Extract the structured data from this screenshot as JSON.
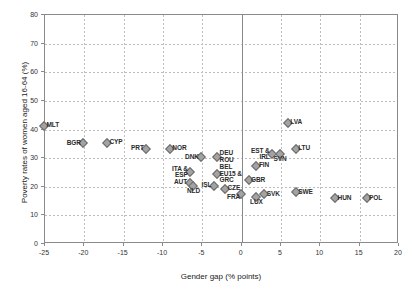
{
  "chart_data": {
    "type": "scatter",
    "title": "",
    "xlabel": "Gender gap (% points)",
    "ylabel": "Poverty rates of women aged 16-64 (%)",
    "xlim": [
      -25,
      20
    ],
    "ylim": [
      0,
      80
    ],
    "xticks": [
      "-25",
      "-20",
      "-15",
      "-10",
      "-5",
      "0",
      "5",
      "10",
      "15",
      "20"
    ],
    "yticks": [
      "0",
      "10",
      "20",
      "30",
      "40",
      "50",
      "60",
      "70",
      "80"
    ],
    "grid": true,
    "legend": "none",
    "marker_color": "#a3a3a3",
    "marker_edge_color": "#6b6b6b",
    "points": [
      {
        "label": "MLT",
        "x": -25.0,
        "y": 41.0,
        "pos": "right"
      },
      {
        "label": "BGR",
        "x": -20.0,
        "y": 34.8,
        "pos": "left"
      },
      {
        "label": "CYP",
        "x": -17.0,
        "y": 35.0,
        "pos": "right"
      },
      {
        "label": "PRT",
        "x": -12.0,
        "y": 33.0,
        "pos": "left"
      },
      {
        "label": "NOR",
        "x": -9.0,
        "y": 33.0,
        "pos": "right"
      },
      {
        "label": "DNK",
        "x": -5.0,
        "y": 30.0,
        "pos": "left"
      },
      {
        "label": "ITA &\nESP",
        "x": -6.4,
        "y": 24.8,
        "pos": "left"
      },
      {
        "label": "AUT",
        "x": -6.5,
        "y": 21.0,
        "pos": "left"
      },
      {
        "label": "NLD",
        "x": -6.0,
        "y": 20.0,
        "pos": "below"
      },
      {
        "label": "ISL",
        "x": -3.4,
        "y": 20.0,
        "pos": "left"
      },
      {
        "label": "DEU\nROU",
        "x": -3.0,
        "y": 30.2,
        "pos": "right"
      },
      {
        "label": "BEL\nEU15 &\nGRC",
        "x": -3.0,
        "y": 24.2,
        "pos": "right"
      },
      {
        "label": "CZE",
        "x": -2.0,
        "y": 19.0,
        "pos": "right"
      },
      {
        "label": "FRA",
        "x": 0.0,
        "y": 17.0,
        "pos": "bl"
      },
      {
        "label": "GBR",
        "x": 1.0,
        "y": 22.0,
        "pos": "right"
      },
      {
        "label": "LUX",
        "x": 2.0,
        "y": 16.0,
        "pos": "below"
      },
      {
        "label": "SVK",
        "x": 3.0,
        "y": 17.0,
        "pos": "right"
      },
      {
        "label": "FIN",
        "x": 2.0,
        "y": 27.0,
        "pos": "right"
      },
      {
        "label": "EST &\nIRL",
        "x": 4.0,
        "y": 31.0,
        "pos": "left"
      },
      {
        "label": "SVN",
        "x": 5.0,
        "y": 31.0,
        "pos": "below"
      },
      {
        "label": "LVA",
        "x": 6.0,
        "y": 42.0,
        "pos": "right"
      },
      {
        "label": "LTU",
        "x": 7.0,
        "y": 33.0,
        "pos": "right"
      },
      {
        "label": "SWE",
        "x": 7.0,
        "y": 17.8,
        "pos": "right"
      },
      {
        "label": "HUN",
        "x": 12.0,
        "y": 15.6,
        "pos": "right"
      },
      {
        "label": "POL",
        "x": 16.0,
        "y": 15.6,
        "pos": "right"
      }
    ]
  }
}
